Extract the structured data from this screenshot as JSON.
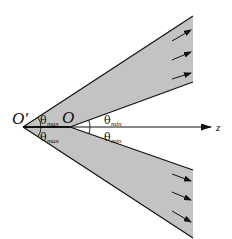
{
  "diagram": {
    "type": "conical beam geometry",
    "colors": {
      "beam_fill": "#c3c3c3",
      "line": "#111111",
      "background": "#ffffff"
    },
    "labels": {
      "apex_outer": "O′",
      "apex_inner": "O",
      "axis": "z",
      "theta_symbol": "θ",
      "theta_max_sub": "max",
      "theta_min_sub": "min"
    },
    "beams": [
      {
        "name": "upper-beam",
        "arrows": 3
      },
      {
        "name": "lower-beam",
        "arrows": 3
      }
    ]
  }
}
